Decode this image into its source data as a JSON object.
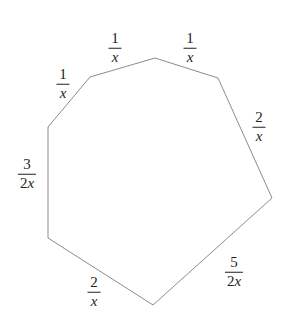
{
  "figure": {
    "name": "labeled-heptagon",
    "type": "geometry-diagram",
    "shape": "heptagon",
    "background_color": "#ffffff",
    "stroke_color": "#8c8c8c",
    "text_color": "#231f20",
    "stroke_width": 1,
    "canvas": {
      "width": 290,
      "height": 330
    },
    "vertices": [
      {
        "id": "v-top",
        "x": 155,
        "y": 58
      },
      {
        "id": "v-upper-right",
        "x": 218,
        "y": 78
      },
      {
        "id": "v-right",
        "x": 272,
        "y": 198
      },
      {
        "id": "v-bottom",
        "x": 153,
        "y": 305
      },
      {
        "id": "v-bottom-left",
        "x": 48,
        "y": 238
      },
      {
        "id": "v-left",
        "x": 48,
        "y": 127
      },
      {
        "id": "v-upper-left",
        "x": 90,
        "y": 77
      }
    ],
    "polygon_points": "155,58 218,78 272,198 153,305 48,238 48,127 90,77"
  },
  "labels": [
    {
      "id": "label-top-left-side",
      "name": "side-label-top-left",
      "numerator": "1",
      "denominator": "x",
      "denominator_coefficient": "",
      "text": "1/x",
      "x": 115,
      "y": 48,
      "between": [
        "v-upper-left",
        "v-top"
      ]
    },
    {
      "id": "label-top-right-side",
      "name": "side-label-top-right",
      "numerator": "1",
      "denominator": "x",
      "denominator_coefficient": "",
      "text": "1/x",
      "x": 190,
      "y": 48,
      "between": [
        "v-top",
        "v-upper-right"
      ]
    },
    {
      "id": "label-upper-left-side",
      "name": "side-label-upper-left",
      "numerator": "1",
      "denominator": "x",
      "denominator_coefficient": "",
      "text": "1/x",
      "x": 63,
      "y": 84,
      "between": [
        "v-left",
        "v-upper-left"
      ]
    },
    {
      "id": "label-right-side",
      "name": "side-label-right",
      "numerator": "2",
      "denominator": "x",
      "denominator_coefficient": "",
      "text": "2/x",
      "x": 259,
      "y": 127,
      "between": [
        "v-upper-right",
        "v-right"
      ]
    },
    {
      "id": "label-left-side",
      "name": "side-label-left",
      "numerator": "3",
      "denominator": "x",
      "denominator_coefficient": "2",
      "text": "3/(2x)",
      "x": 27,
      "y": 174,
      "between": [
        "v-left",
        "v-bottom-left"
      ]
    },
    {
      "id": "label-lower-right-side",
      "name": "side-label-lower-right",
      "numerator": "5",
      "denominator": "x",
      "denominator_coefficient": "2",
      "text": "5/(2x)",
      "x": 234,
      "y": 272,
      "between": [
        "v-right",
        "v-bottom"
      ]
    },
    {
      "id": "label-bottom-left-side",
      "name": "side-label-bottom-left",
      "numerator": "2",
      "denominator": "x",
      "denominator_coefficient": "",
      "text": "2/x",
      "x": 94,
      "y": 292,
      "between": [
        "v-bottom-left",
        "v-bottom"
      ]
    }
  ]
}
